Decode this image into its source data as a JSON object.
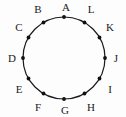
{
  "figure": {
    "type": "labeled-circle-diagram",
    "background_color": "#fdfdfd",
    "stroke_color": "#1a1a1a",
    "label_color": "#1a1a1a",
    "circle": {
      "center_x": 64,
      "center_y": 58,
      "radius": 41,
      "stroke_width": 1.2
    },
    "point_marker": {
      "shape": "filled-circle",
      "radius": 1.9,
      "fill": "#111111"
    },
    "label_radius": 52,
    "vertices": [
      {
        "label": "A",
        "angle_deg": 90,
        "marker_x": 64,
        "marker_y": 17,
        "label_x": 66,
        "label_y": 7
      },
      {
        "label": "B",
        "angle_deg": 120,
        "marker_x": 43.5,
        "marker_y": 22.5,
        "label_x": 38,
        "label_y": 9
      },
      {
        "label": "C",
        "angle_deg": 150,
        "marker_x": 28.5,
        "marker_y": 37.5,
        "label_x": 19,
        "label_y": 27
      },
      {
        "label": "D",
        "angle_deg": 180,
        "marker_x": 23,
        "marker_y": 58,
        "label_x": 12,
        "label_y": 58
      },
      {
        "label": "E",
        "angle_deg": 210,
        "marker_x": 28.5,
        "marker_y": 78.5,
        "label_x": 19,
        "label_y": 89
      },
      {
        "label": "F",
        "angle_deg": 240,
        "marker_x": 43.5,
        "marker_y": 93.5,
        "label_x": 38,
        "label_y": 107
      },
      {
        "label": "G",
        "angle_deg": 270,
        "marker_x": 64,
        "marker_y": 99,
        "label_x": 65,
        "label_y": 110
      },
      {
        "label": "H",
        "angle_deg": 300,
        "marker_x": 84.5,
        "marker_y": 93.5,
        "label_x": 91,
        "label_y": 107
      },
      {
        "label": "I",
        "angle_deg": 330,
        "marker_x": 99.5,
        "marker_y": 78.5,
        "label_x": 110,
        "label_y": 89
      },
      {
        "label": "J",
        "angle_deg": 0,
        "marker_x": 105,
        "marker_y": 58,
        "label_x": 116,
        "label_y": 58
      },
      {
        "label": "K",
        "angle_deg": 30,
        "marker_x": 99.5,
        "marker_y": 37.5,
        "label_x": 110,
        "label_y": 27
      },
      {
        "label": "L",
        "angle_deg": 60,
        "marker_x": 84.5,
        "marker_y": 22.5,
        "label_x": 91,
        "label_y": 9
      }
    ]
  }
}
